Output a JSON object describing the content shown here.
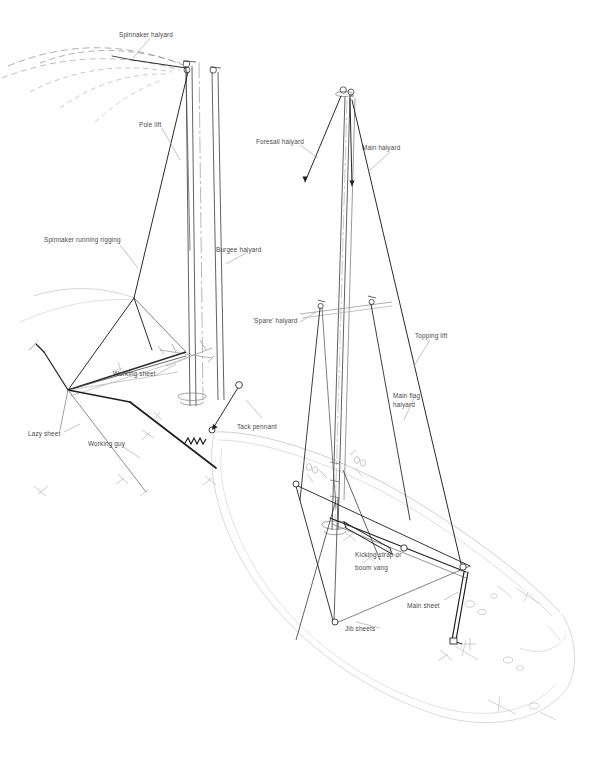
{
  "diagram": {
    "background_color": "#ffffff",
    "line_color": "#2b2b2b",
    "faint_line_color": "#c9c9c9",
    "hull_line_color": "#bfbfbf",
    "text_color": "#2a2a2a",
    "labels": [
      {
        "id": "spinnaker-halyard",
        "text": "Spinnaker halyard",
        "x": 119,
        "y": 31
      },
      {
        "id": "pole-lift",
        "text": "Pole lift",
        "x": 139,
        "y": 121
      },
      {
        "id": "foresail-halyard",
        "text": "Foresail halyard",
        "x": 256,
        "y": 138
      },
      {
        "id": "main-halyard",
        "text": "Main halyard",
        "x": 362,
        "y": 144
      },
      {
        "id": "burgee-halyard",
        "text": "Burgee halyard",
        "x": 216,
        "y": 246
      },
      {
        "id": "spinnaker-running-rigging",
        "text": "Spinnaker running rigging",
        "x": 44,
        "y": 236
      },
      {
        "id": "spare-halyard",
        "text": "'Spare' halyard",
        "x": 253,
        "y": 317
      },
      {
        "id": "topping-lift",
        "text": "Topping lift",
        "x": 415,
        "y": 332
      },
      {
        "id": "working-sheet",
        "text": "Working sheet",
        "x": 113,
        "y": 370
      },
      {
        "id": "main-flag-halyard-1",
        "text": "Main flag",
        "x": 393,
        "y": 392
      },
      {
        "id": "main-flag-halyard-2",
        "text": "halyard",
        "x": 393,
        "y": 401
      },
      {
        "id": "tack-pennant",
        "text": "Tack pennant",
        "x": 237,
        "y": 423
      },
      {
        "id": "lazy-sheet",
        "text": "Lazy sheet",
        "x": 28,
        "y": 430
      },
      {
        "id": "working-guy",
        "text": "Working guy",
        "x": 88,
        "y": 440
      },
      {
        "id": "kicking-strap-1",
        "text": "Kicking strap or",
        "x": 355,
        "y": 551
      },
      {
        "id": "kicking-strap-2",
        "text": "boom vang",
        "x": 355,
        "y": 564
      },
      {
        "id": "main-sheet",
        "text": "Main sheet",
        "x": 407,
        "y": 602
      },
      {
        "id": "jib-sheets",
        "text": "Jib sheets",
        "x": 345,
        "y": 625
      }
    ],
    "parts": [
      "spinnaker-sail-arcs",
      "foremast-group",
      "mainmast-group",
      "spinnaker-pole",
      "boom",
      "hull-outline",
      "deck-fittings"
    ]
  }
}
